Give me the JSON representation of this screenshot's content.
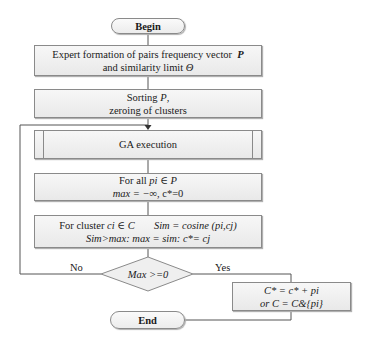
{
  "diagram": {
    "type": "flowchart",
    "nodes": {
      "begin": {
        "label": "Begin",
        "shape": "terminator"
      },
      "expert": {
        "line1_prefix": "Expert formation of pairs frequency vector",
        "line1_var": "P",
        "line2_prefix": "and similarity limit",
        "line2_var": "Θ"
      },
      "sorting": {
        "line1_prefix": "Sorting",
        "line1_var": "P",
        "line1_suffix": ",",
        "line2": "zeroing of clusters"
      },
      "ga": {
        "label": "GA execution",
        "shape": "predefined-process"
      },
      "forall": {
        "line1_prefix": "For all",
        "line1_expr": "pi ∈ P",
        "line2_expr": "max = −∞",
        "line2_suffix": ", c*=0"
      },
      "forcluster": {
        "line1_prefix": "For cluster",
        "line1_expr": "ci ∈ C",
        "line1_sim": "Sim = cosine (pi,cj)",
        "line2": "Sim>max: max = sim: c*= cj"
      },
      "decision": {
        "label": "Max >=0",
        "shape": "diamond"
      },
      "update": {
        "line1": "C* = c* + pi",
        "line2": "or C = C&{pi}"
      },
      "end": {
        "label": "End",
        "shape": "terminator"
      }
    },
    "edges": {
      "no_label": "No",
      "yes_label": "Yes"
    },
    "colors": {
      "line": "#555555",
      "box_border": "#8a8a8a",
      "box_fill_top": "#f7f7f7",
      "box_fill_bottom": "#e9e9e9"
    }
  }
}
